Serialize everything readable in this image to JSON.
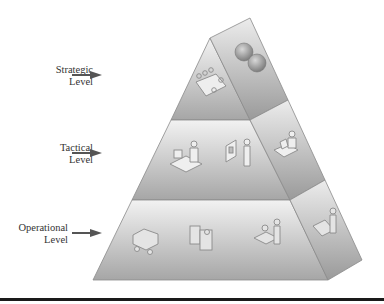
{
  "diagram": {
    "type": "pyramid",
    "levels": [
      {
        "name": "strategic",
        "line1": "Strategic",
        "line2": "Level",
        "icons": [
          "meeting-table-icon",
          "globes-icon"
        ]
      },
      {
        "name": "tactical",
        "line1": "Tactical",
        "line2": "Level",
        "icons": [
          "desk-worker-icon",
          "presenter-icon",
          "laptop-worker-icon"
        ]
      },
      {
        "name": "operational",
        "line1": "Operational",
        "line2": "Level",
        "icons": [
          "forklift-icon",
          "machine-operator-icon",
          "assembly-worker-icon",
          "packing-worker-icon"
        ]
      }
    ],
    "colors": {
      "face_light": "#e9e9e9",
      "face_dark": "#a8a8a8",
      "edge": "#8a8a8a",
      "arrow": "#555555",
      "rule": "#1a1a1a"
    }
  }
}
